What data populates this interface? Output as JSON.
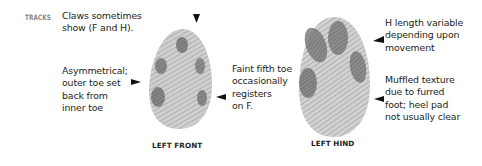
{
  "section": {
    "label": "TRACKS",
    "label_color": "#8a8a8a"
  },
  "notes": {
    "claws": [
      "Claws sometimes",
      "show (F and H)."
    ],
    "asymmetrical": [
      "Asymmetrical;",
      "outer toe set",
      "back from",
      "inner toe"
    ],
    "fifth_toe": [
      "Faint fifth toe",
      "occasionally",
      "registers",
      "on F."
    ],
    "h_length": [
      "H length variable",
      "depending upon",
      "movement"
    ],
    "muffled": [
      "Muffled texture",
      "due to furred",
      "foot; heel pad",
      "not usually clear"
    ]
  },
  "tracks": [
    {
      "id": "left-front",
      "caption": "LEFT FRONT",
      "fill": "#c4c4c4",
      "pad_color": "#6e6e6e"
    },
    {
      "id": "left-hind",
      "caption": "LEFT HIND",
      "fill": "#c6c6c6",
      "pad_color": "#727272"
    }
  ],
  "arrows": [
    {
      "id": "top-front",
      "direction": "down"
    },
    {
      "id": "left-front-side",
      "direction": "right"
    },
    {
      "id": "right-front-side",
      "direction": "left"
    },
    {
      "id": "hind-upper",
      "direction": "left"
    },
    {
      "id": "hind-lower",
      "direction": "left"
    }
  ]
}
